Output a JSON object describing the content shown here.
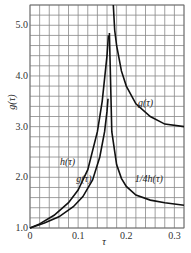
{
  "chart_data": {
    "type": "line",
    "title": "",
    "xlabel": "τ",
    "ylabel": "g(τ)",
    "xlim": [
      0,
      0.32
    ],
    "ylim": [
      1.0,
      5.4
    ],
    "grid": true,
    "x_ticks": [
      "0",
      "0.1",
      "0.2",
      "0.3"
    ],
    "y_ticks": [
      "1.0",
      "2.0",
      "3.0",
      "4.0",
      "5.0"
    ],
    "series": [
      {
        "name": "h(τ)",
        "x": [
          0,
          0.02,
          0.05,
          0.08,
          0.1,
          0.12,
          0.14,
          0.15,
          0.16,
          0.163
        ],
        "y": [
          1.0,
          1.08,
          1.25,
          1.5,
          1.75,
          2.15,
          2.9,
          3.5,
          4.4,
          4.8
        ]
      },
      {
        "name": "g(τ)",
        "x": [
          0,
          0.03,
          0.06,
          0.09,
          0.11,
          0.13,
          0.145,
          0.155,
          0.16,
          0.162
        ],
        "y": [
          1.0,
          1.1,
          1.22,
          1.42,
          1.62,
          1.95,
          2.4,
          2.9,
          3.3,
          3.55
        ]
      },
      {
        "name": "1/4h(τ)",
        "x": [
          0.165,
          0.17,
          0.18,
          0.19,
          0.2,
          0.22,
          0.25,
          0.28,
          0.32
        ],
        "y": [
          4.85,
          2.9,
          2.25,
          1.98,
          1.82,
          1.65,
          1.55,
          1.5,
          1.45
        ]
      },
      {
        "name": "g(τ) upper",
        "x": [
          0.173,
          0.176,
          0.18,
          0.19,
          0.2,
          0.22,
          0.25,
          0.28,
          0.32
        ],
        "y": [
          5.4,
          4.9,
          4.6,
          4.1,
          3.8,
          3.45,
          3.2,
          3.05,
          3.0
        ]
      }
    ],
    "annotations": [
      {
        "text": "g(τ)",
        "x": 0.24,
        "y": 3.4
      },
      {
        "text": "h(τ)",
        "x": 0.078,
        "y": 2.25
      },
      {
        "text": "g(τ)",
        "x": 0.112,
        "y": 1.9
      },
      {
        "text": "1/4h(τ)",
        "x": 0.247,
        "y": 1.9
      }
    ]
  }
}
